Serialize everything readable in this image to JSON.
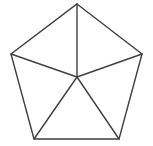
{
  "figure": {
    "shape_type": "pentagon",
    "canvas": {
      "width": 153,
      "height": 146
    },
    "style": {
      "background_color": "#ffffff",
      "stroke_color": "#3f3f3f",
      "stroke_width": 1.4,
      "fill": "none"
    },
    "vertices": [
      {
        "name": "top",
        "x": 77,
        "y": 4
      },
      {
        "name": "right",
        "x": 142,
        "y": 54
      },
      {
        "name": "bottom-right",
        "x": 119,
        "y": 139
      },
      {
        "name": "bottom-left",
        "x": 34,
        "y": 139
      },
      {
        "name": "left",
        "x": 11,
        "y": 54
      }
    ],
    "center": {
      "name": "center",
      "x": 77,
      "y": 77
    },
    "outline_points": "77,4 142,54 119,139 34,139 11,54",
    "spokes": [
      {
        "name": "spoke-center-to-top",
        "x1": 77,
        "y1": 77,
        "x2": 77,
        "y2": 4
      },
      {
        "name": "spoke-center-to-right",
        "x1": 77,
        "y1": 77,
        "x2": 142,
        "y2": 54
      },
      {
        "name": "spoke-center-to-bottom-right",
        "x1": 77,
        "y1": 77,
        "x2": 119,
        "y2": 139
      },
      {
        "name": "spoke-center-to-bottom-left",
        "x1": 77,
        "y1": 77,
        "x2": 34,
        "y2": 139
      },
      {
        "name": "spoke-center-to-left",
        "x1": 77,
        "y1": 77,
        "x2": 11,
        "y2": 54
      }
    ]
  }
}
